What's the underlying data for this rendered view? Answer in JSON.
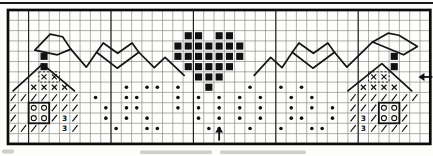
{
  "canvas": {
    "width": 433,
    "height": 156,
    "background": "#fdfdfb",
    "ink": "#111111"
  },
  "grid": {
    "cols": 41,
    "rows": 13,
    "origin_x": 8,
    "origin_y": 10,
    "cell": 10.3,
    "line_color": "#4f4f4f",
    "line_width": 0.6,
    "line_opacity": 0.75,
    "heavy_cols": [
      2,
      10,
      18,
      26,
      34
    ],
    "heavy_col_color": "#1c1c1c",
    "heavy_col_width": 1.1,
    "border_color": "#0c0c0c",
    "border_width": 2.7
  },
  "legend": {
    "B": "filled-square-stitch",
    "X": "x-stitch",
    "/": "slash-stitch",
    "O": "circle-stitch",
    "3": "numeral-3-stitch",
    "*": "dot-french-knot"
  },
  "pattern_rows": [
    ".........................................",
    ".........................................",
    ".................BB.BB...................",
    "................BBBBBBB..................",
    "...B............BBBBBBB..............B...",
    "...B.............BBBBB...............B...",
    "...XX.............BBB..............XX....",
    "..XXXX.....*.**.*..B...*..*.*.....XXXX...",
    "///////.*..**...*.*.*.*.*..*.*...///////.",
    "/.OO///..*.**...*.*.*.*.*..*.*.*.///OO/..",
    "/.OO/3/..*.*.*....*.*.*.*..**..*./3/OO/..",
    "////.3/...*..**....**..*..*..**../3////..",
    "........................................."
  ],
  "bold_boxes": [
    {
      "c": 2,
      "r": 9,
      "w": 2,
      "h": 2
    },
    {
      "c": 36,
      "r": 9,
      "w": 2,
      "h": 2
    }
  ],
  "dashed_boxes": [
    {
      "c": 3,
      "r": 6,
      "w": 2,
      "h": 1
    },
    {
      "c": 35,
      "r": 6,
      "w": 2,
      "h": 1
    }
  ],
  "backstitch": {
    "color": "#141414",
    "width": 1.7,
    "paths": [
      {
        "name": "left-house-roof",
        "points": [
          [
            0.5,
            7.85
          ],
          [
            3.35,
            5.25
          ],
          [
            6.45,
            7.85
          ]
        ]
      },
      {
        "name": "left-pennant",
        "points": [
          [
            2.6,
            3.9
          ],
          [
            4.1,
            2.35
          ],
          [
            5.3,
            2.6
          ],
          [
            6.1,
            3.8
          ],
          [
            4.8,
            4.35
          ],
          [
            2.6,
            3.9
          ]
        ]
      },
      {
        "name": "left-garland-dip",
        "points": [
          [
            6.1,
            3.8
          ],
          [
            7.6,
            5.55
          ],
          [
            8.6,
            4.1
          ]
        ]
      },
      {
        "name": "left-heart-outline",
        "points": [
          [
            10.6,
            5.65
          ],
          [
            8.6,
            4.1
          ],
          [
            9.25,
            3.2
          ],
          [
            10.65,
            4.2
          ],
          [
            12.05,
            3.2
          ],
          [
            12.7,
            4.1
          ],
          [
            10.6,
            5.65
          ]
        ]
      },
      {
        "name": "left-center-garland",
        "points": [
          [
            12.7,
            4.1
          ],
          [
            14.2,
            5.6
          ],
          [
            15.25,
            4.6
          ],
          [
            17.1,
            6.35
          ]
        ]
      },
      {
        "name": "right-center-garland",
        "points": [
          [
            23.9,
            6.35
          ],
          [
            25.5,
            4.6
          ],
          [
            26.6,
            5.6
          ],
          [
            27.6,
            4.1
          ]
        ]
      },
      {
        "name": "right-heart-outline",
        "points": [
          [
            29.6,
            5.65
          ],
          [
            27.6,
            4.1
          ],
          [
            28.25,
            3.2
          ],
          [
            29.65,
            4.2
          ],
          [
            31.05,
            3.2
          ],
          [
            31.7,
            4.1
          ],
          [
            29.6,
            5.65
          ]
        ]
      },
      {
        "name": "right-garland-dip",
        "points": [
          [
            31.7,
            4.1
          ],
          [
            32.9,
            5.55
          ],
          [
            35.4,
            3.1
          ]
        ]
      },
      {
        "name": "right-pennant",
        "points": [
          [
            35.4,
            3.1
          ],
          [
            36.9,
            2.25
          ],
          [
            37.95,
            2.45
          ],
          [
            39.75,
            3.55
          ],
          [
            38.4,
            4.35
          ],
          [
            35.4,
            3.1
          ]
        ]
      },
      {
        "name": "right-house-roof",
        "points": [
          [
            33.0,
            7.85
          ],
          [
            36.3,
            5.2
          ],
          [
            39.2,
            7.85
          ]
        ]
      }
    ]
  },
  "arrows": {
    "bottom_center": {
      "x_col": 20.5,
      "tip_y_row": 11.3,
      "base_y_row": 12.68
    },
    "right_center": {
      "y_row": 6.5,
      "tip_x_col": 39.85,
      "base_x_col": 41.2
    }
  },
  "top_rule": {
    "y": 3,
    "color": "#1a1a1a",
    "width": 1.8
  },
  "caption_smudges": [
    {
      "x": 2,
      "y": 149.5,
      "w": 12,
      "h": 4
    },
    {
      "x": 140,
      "y": 150.5,
      "w": 72,
      "h": 3.4
    },
    {
      "x": 220,
      "y": 150.5,
      "w": 86,
      "h": 3.4
    }
  ]
}
